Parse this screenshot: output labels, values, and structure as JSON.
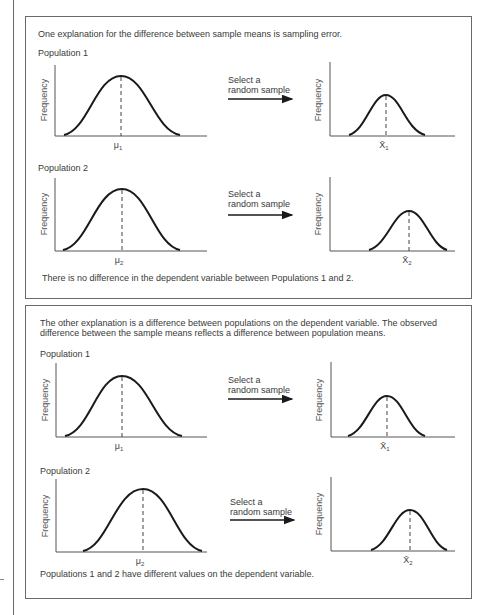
{
  "panels": [
    {
      "heading": [
        "One explanation for the difference between sample means is sampling error."
      ],
      "rows": [
        {
          "population_label": "Population 1",
          "population_chart": {
            "ylabel": "Frequency",
            "mean_label": "μ",
            "mean_sub": "1"
          },
          "arrow_text": [
            "Select a",
            "random sample"
          ],
          "sample_chart": {
            "ylabel": "Frequency",
            "mean_label": "X̄",
            "mean_sub": "1"
          }
        },
        {
          "population_label": "Population 2",
          "population_chart": {
            "ylabel": "Frequency",
            "mean_label": "μ",
            "mean_sub": "2"
          },
          "arrow_text": [
            "Select a",
            "random sample"
          ],
          "sample_chart": {
            "ylabel": "Frequency",
            "mean_label": "X̄",
            "mean_sub": "2"
          }
        }
      ],
      "footer": "There is no difference in the dependent variable between Populations 1 and 2."
    },
    {
      "heading": [
        "The other explanation is a difference between populations on the dependent variable.  The observed",
        "difference between the sample means reflects a difference between population means."
      ],
      "rows": [
        {
          "population_label": "Population 1",
          "population_chart": {
            "ylabel": "Frequency",
            "mean_label": "μ",
            "mean_sub": "1"
          },
          "arrow_text": [
            "Select a",
            "random sample"
          ],
          "sample_chart": {
            "ylabel": "Frequency",
            "mean_label": "X̄",
            "mean_sub": "1"
          }
        },
        {
          "population_label": "Population 2",
          "population_chart": {
            "ylabel": "Frequency",
            "mean_label": "μ",
            "mean_sub": "2"
          },
          "arrow_text": [
            "Select a",
            "random sample"
          ],
          "sample_chart": {
            "ylabel": "Frequency",
            "mean_label": "X̄",
            "mean_sub": "2"
          }
        }
      ],
      "footer": "Populations 1 and 2 have different values on the dependent variable."
    }
  ],
  "colors": {
    "line": "#1a1a1a",
    "axis": "#555555",
    "border": "#6a6a6a",
    "text": "#3a3a3a"
  }
}
